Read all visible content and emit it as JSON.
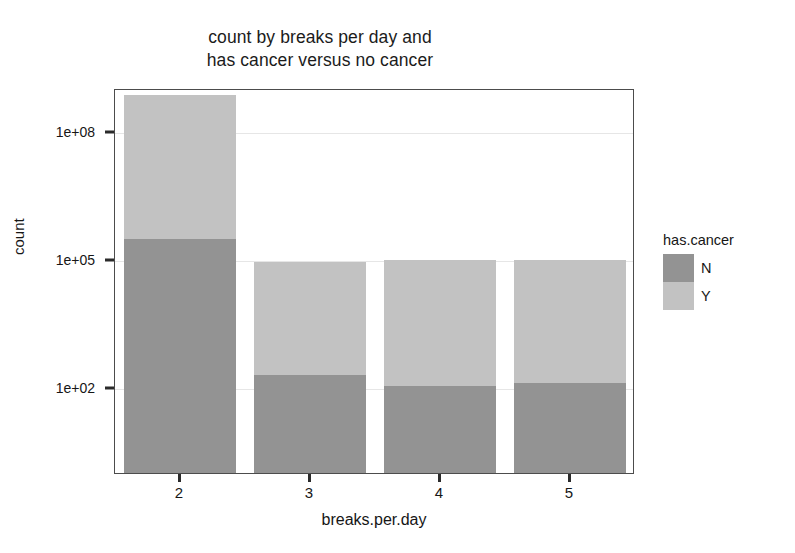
{
  "chart_data": {
    "type": "bar",
    "title": "count by breaks per day and has cancer versus no cancer",
    "title_lines": [
      "count by breaks per day and",
      "has cancer versus no cancer"
    ],
    "xlabel": "breaks.per.day",
    "ylabel": "count",
    "stacked": true,
    "yscale": "log",
    "ylim": [
      1,
      1000000000
    ],
    "grid": true,
    "legend_position": "right",
    "legend_title": "has.cancer",
    "categories": [
      "2",
      "3",
      "4",
      "5"
    ],
    "series": [
      {
        "name": "N",
        "color": "#939393",
        "values": [
          300000,
          200,
          110,
          130
        ]
      },
      {
        "name": "Y",
        "color": "#c2c2c2",
        "values": [
          700000000,
          85000,
          93000,
          95000
        ]
      }
    ],
    "y_ticks": [
      {
        "label": "1e+08",
        "value": 100000000
      },
      {
        "label": "1e+05",
        "value": 100000
      },
      {
        "label": "1e+02",
        "value": 100
      }
    ],
    "x_ticks": [
      "2",
      "3",
      "4",
      "5"
    ]
  }
}
